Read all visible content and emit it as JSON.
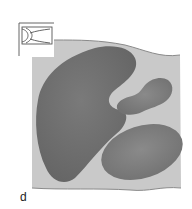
{
  "figure": {
    "panel_label": "d",
    "colors": {
      "background": "#ffffff",
      "tissue": "#c9c9c9",
      "tissue_edge": "#8a8a8a",
      "organ_dark": "#6e6e6e",
      "organ_mid": "#7c7c7c",
      "organ_light": "#858585",
      "inset_line": "#555555"
    },
    "inset_icon": "cross-section-orientation-icon",
    "regions": [
      {
        "name": "large-organ-left",
        "shape": "kidney"
      },
      {
        "name": "small-organ-upper-right",
        "shape": "blob"
      },
      {
        "name": "oval-organ-lower-right",
        "shape": "ellipse"
      }
    ]
  }
}
